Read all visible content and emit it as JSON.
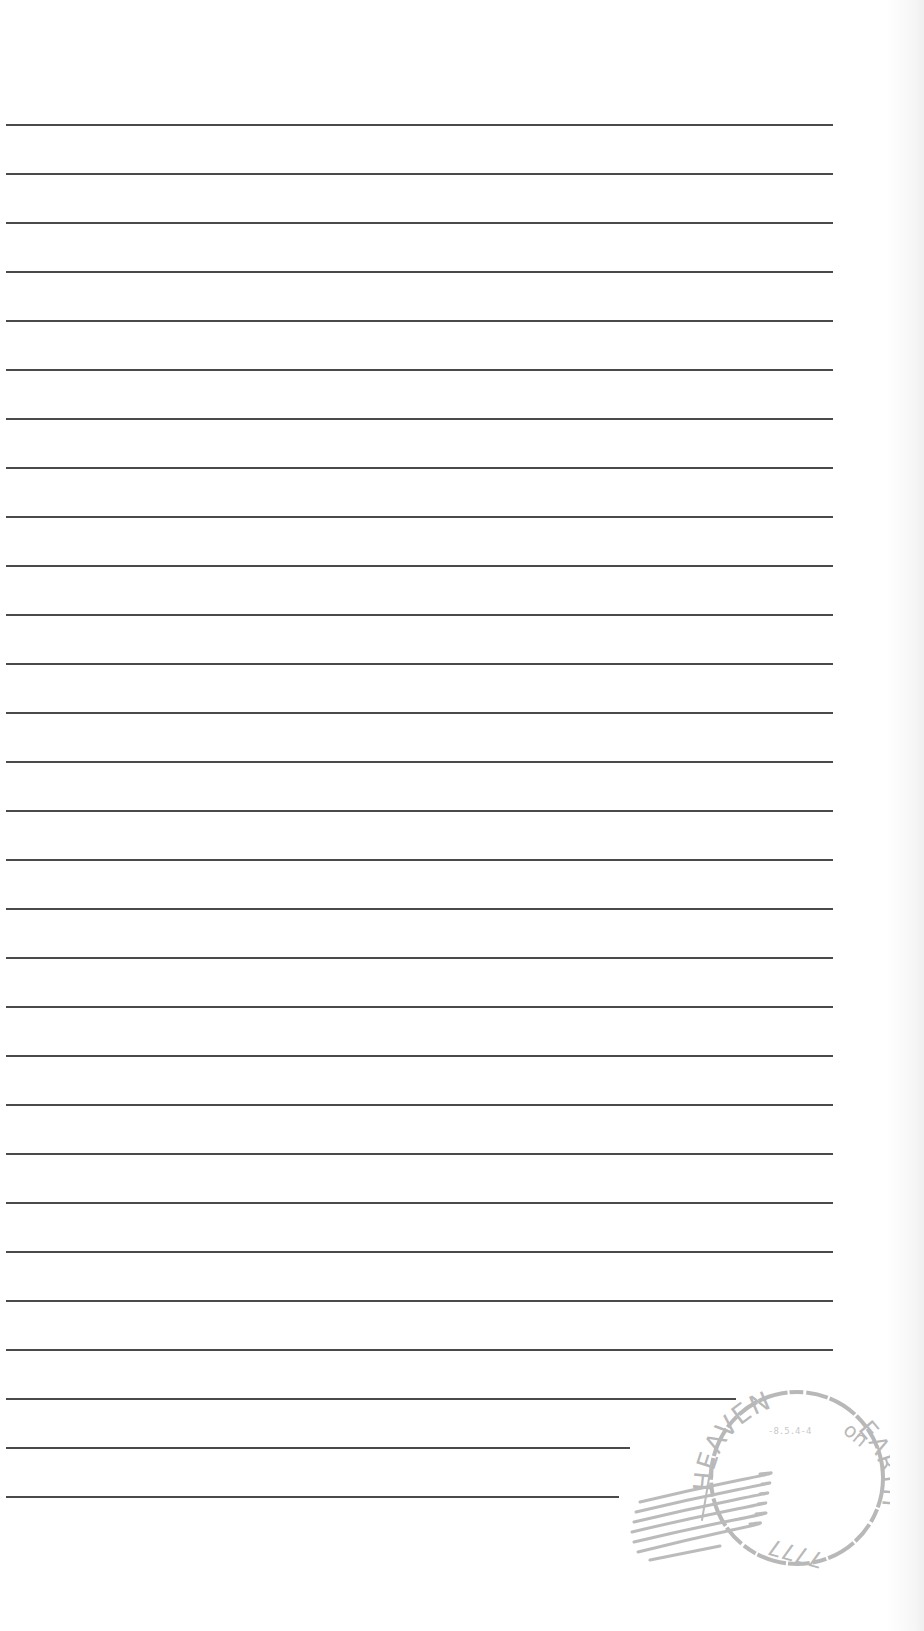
{
  "page": {
    "type": "lined-letter-paper",
    "background": "#ffffff",
    "rule_color": "#4a4a4a",
    "rule_start_y": 125,
    "rule_spacing": 49,
    "rule_count": 29
  },
  "rules": [
    {
      "y": 125,
      "x1": 6,
      "x2": 833
    },
    {
      "y": 174,
      "x1": 6,
      "x2": 833
    },
    {
      "y": 223,
      "x1": 6,
      "x2": 833
    },
    {
      "y": 272,
      "x1": 6,
      "x2": 833
    },
    {
      "y": 321,
      "x1": 6,
      "x2": 833
    },
    {
      "y": 370,
      "x1": 6,
      "x2": 833
    },
    {
      "y": 419,
      "x1": 6,
      "x2": 833
    },
    {
      "y": 468,
      "x1": 6,
      "x2": 833
    },
    {
      "y": 517,
      "x1": 6,
      "x2": 833
    },
    {
      "y": 566,
      "x1": 6,
      "x2": 833
    },
    {
      "y": 615,
      "x1": 6,
      "x2": 833
    },
    {
      "y": 664,
      "x1": 6,
      "x2": 833
    },
    {
      "y": 713,
      "x1": 6,
      "x2": 833
    },
    {
      "y": 762,
      "x1": 6,
      "x2": 833
    },
    {
      "y": 811,
      "x1": 6,
      "x2": 833
    },
    {
      "y": 860,
      "x1": 6,
      "x2": 833
    },
    {
      "y": 909,
      "x1": 6,
      "x2": 833
    },
    {
      "y": 958,
      "x1": 6,
      "x2": 833
    },
    {
      "y": 1007,
      "x1": 6,
      "x2": 833
    },
    {
      "y": 1056,
      "x1": 6,
      "x2": 833
    },
    {
      "y": 1105,
      "x1": 6,
      "x2": 833
    },
    {
      "y": 1154,
      "x1": 6,
      "x2": 833
    },
    {
      "y": 1203,
      "x1": 6,
      "x2": 833
    },
    {
      "y": 1252,
      "x1": 6,
      "x2": 833
    },
    {
      "y": 1301,
      "x1": 6,
      "x2": 833
    },
    {
      "y": 1350,
      "x1": 6,
      "x2": 833
    },
    {
      "y": 1399,
      "x1": 6,
      "x2": 736
    },
    {
      "y": 1448,
      "x1": 6,
      "x2": 630
    },
    {
      "y": 1497,
      "x1": 6,
      "x2": 619
    }
  ],
  "stamp": {
    "icon": "postmark-stamp-icon",
    "top_text": "HEAVEN",
    "middle_word": "on",
    "right_text": "EARTH",
    "bottom_text": "7777",
    "center_code": "-8.5.4-4",
    "color": "#8a8a8a"
  }
}
